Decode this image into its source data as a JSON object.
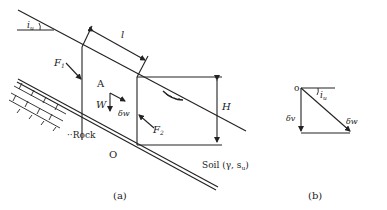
{
  "figure": {
    "panel_a": {
      "caption": "(a)",
      "labels": {
        "slope_angle": "i",
        "slope_angle_sub": "u",
        "length": "l",
        "force_left": "F",
        "force_left_sub": "1",
        "block": "A",
        "weight": "W",
        "displacement": "δw",
        "force_right": "F",
        "force_right_sub": "2",
        "height": "H",
        "rock": "Rock",
        "origin": "O",
        "soil": "Soil (γ, s",
        "soil_sub": "u",
        "soil_close": ")"
      }
    },
    "panel_b": {
      "caption": "(b)",
      "labels": {
        "origin": "o",
        "angle": "i",
        "angle_sub": "u",
        "vertical": "δv",
        "resultant": "δw"
      }
    },
    "colors": {
      "line": "#222222",
      "background": "#ffffff"
    }
  }
}
